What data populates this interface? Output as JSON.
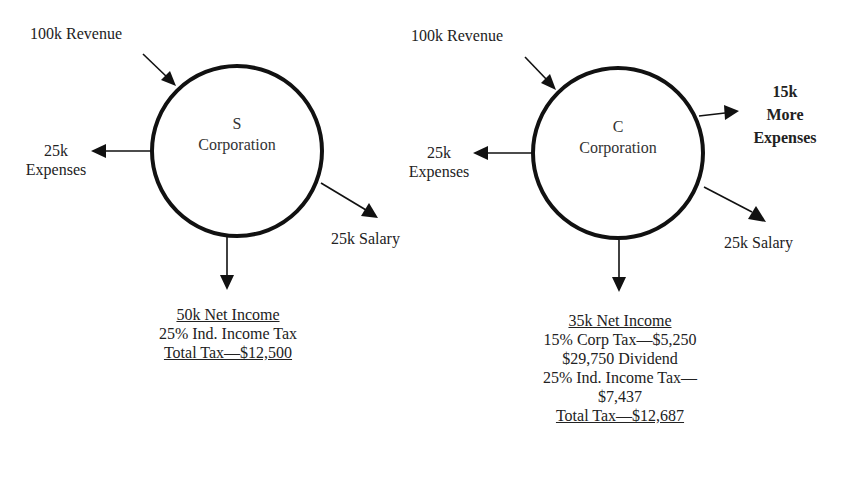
{
  "s_corp": {
    "letter": "S",
    "name": "Corporation",
    "revenue": "100k Revenue",
    "expenses_amount": "25k",
    "expenses_label": "Expenses",
    "salary": "25k Salary",
    "summary": {
      "net_income": "50k Net Income",
      "ind_tax": "25% Ind. Income Tax",
      "total_tax": "Total Tax—$12,500"
    }
  },
  "c_corp": {
    "letter": "C",
    "name": "Corporation",
    "revenue": "100k Revenue",
    "expenses_amount": "25k",
    "expenses_label": "Expenses",
    "more_expenses_amount": "15k",
    "more_expenses_line1": "More",
    "more_expenses_line2": "Expenses",
    "salary": "25k Salary",
    "summary": {
      "net_income": "35k Net Income",
      "corp_tax": "15% Corp Tax—$5,250",
      "dividend": "$29,750 Dividend",
      "ind_tax_line1": "25% Ind. Income Tax—",
      "ind_tax_line2": "$7,437",
      "total_tax": "Total Tax—$12,687"
    }
  },
  "colors": {
    "stroke": "#111111",
    "text": "#222222",
    "background": "#ffffff"
  }
}
